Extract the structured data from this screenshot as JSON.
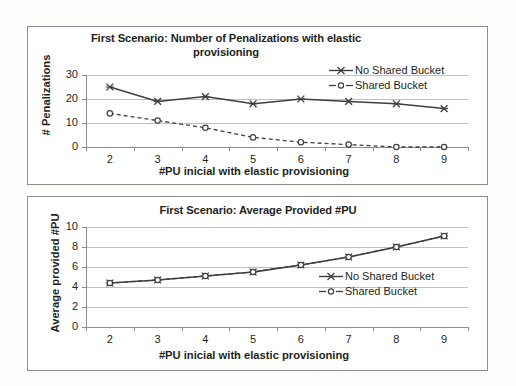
{
  "figure": {
    "background": "#fdfdfc",
    "frame_color": "#8d8d8d",
    "text_color": "#231f20",
    "grid_color": "#bfbfbf",
    "series_color": "#3f3f3f"
  },
  "chart_data": [
    {
      "id": "top",
      "type": "line",
      "title": "First Scenario: Number of Penalizations with elastic provisioning",
      "xlabel": "#PU inicial with elastic provisioning",
      "ylabel": "# Penalizations",
      "x": [
        2,
        3,
        4,
        5,
        6,
        7,
        8,
        9
      ],
      "xticklabels": [
        "2",
        "3",
        "4",
        "5",
        "6",
        "7",
        "8",
        "9"
      ],
      "yticklabels": [
        "0",
        "10",
        "20",
        "30"
      ],
      "yticks": [
        0,
        10,
        20,
        30
      ],
      "ylim": [
        0,
        30
      ],
      "xlim": [
        1.5,
        9.5
      ],
      "grid": true,
      "legend_position": "top-right",
      "series": [
        {
          "name": "No Shared Bucket",
          "style": "solid",
          "marker": "x",
          "values": [
            25,
            19,
            21,
            18,
            20,
            19,
            18,
            16
          ]
        },
        {
          "name": "Shared Bucket",
          "style": "dashed",
          "marker": "circle",
          "values": [
            14,
            11,
            8,
            4,
            2,
            1,
            0,
            0
          ]
        }
      ]
    },
    {
      "id": "bottom",
      "type": "line",
      "title": "First Scenario: Average Provided #PU",
      "xlabel": "#PU inicial with elastic provisioning",
      "ylabel": "Average provided #PU",
      "x": [
        2,
        3,
        4,
        5,
        6,
        7,
        8,
        9
      ],
      "xticklabels": [
        "2",
        "3",
        "4",
        "5",
        "6",
        "7",
        "8",
        "9"
      ],
      "yticklabels": [
        "0",
        "2",
        "4",
        "6",
        "8",
        "10"
      ],
      "yticks": [
        0,
        2,
        4,
        6,
        8,
        10
      ],
      "ylim": [
        0,
        10
      ],
      "xlim": [
        1.5,
        9.5
      ],
      "grid": true,
      "legend_position": "center-right",
      "series": [
        {
          "name": "No Shared Bucket",
          "style": "solid",
          "marker": "x",
          "values": [
            4.4,
            4.7,
            5.1,
            5.5,
            6.2,
            7.0,
            8.0,
            9.1
          ]
        },
        {
          "name": "Shared Bucket",
          "style": "dashed",
          "marker": "circle",
          "values": [
            4.4,
            4.7,
            5.1,
            5.5,
            6.2,
            7.0,
            8.0,
            9.1
          ]
        }
      ]
    }
  ]
}
